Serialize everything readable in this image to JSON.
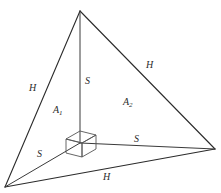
{
  "figure": {
    "type": "geometry-diagram",
    "background_color": "#ffffff",
    "line_color": "#2b2b2b",
    "labels": [
      {
        "id": "h-left",
        "text": "H",
        "sub": "",
        "x": 29,
        "y": 83
      },
      {
        "id": "h-right",
        "text": "H",
        "sub": "",
        "x": 146,
        "y": 60
      },
      {
        "id": "s-vert",
        "text": "S",
        "sub": "",
        "x": 85,
        "y": 76
      },
      {
        "id": "a1",
        "text": "A",
        "sub": "1",
        "x": 53,
        "y": 105
      },
      {
        "id": "a2",
        "text": "A",
        "sub": "2",
        "x": 123,
        "y": 97
      },
      {
        "id": "s-left",
        "text": "S",
        "sub": "",
        "x": 37,
        "y": 149
      },
      {
        "id": "s-base",
        "text": "S",
        "sub": "",
        "x": 134,
        "y": 134
      },
      {
        "id": "h-bottom",
        "text": "H",
        "sub": "",
        "x": 103,
        "y": 172
      }
    ],
    "vertices": {
      "apex": {
        "x": 80,
        "y": 11
      },
      "bottom_left": {
        "x": 5,
        "y": 187
      },
      "right": {
        "x": 215,
        "y": 149
      },
      "foot": {
        "x": 80,
        "y": 143
      }
    },
    "edges": [
      {
        "id": "apex-to-bottom-left",
        "label": "H"
      },
      {
        "id": "apex-to-right",
        "label": "H"
      },
      {
        "id": "bottom-left-to-right",
        "label": "H"
      },
      {
        "id": "apex-to-foot",
        "label": "S"
      },
      {
        "id": "bottom-left-to-foot",
        "label": "S"
      },
      {
        "id": "foot-to-right",
        "label": "S"
      }
    ],
    "faces": [
      {
        "id": "left-face",
        "label": "A",
        "sub": "1"
      },
      {
        "id": "right-face",
        "label": "A",
        "sub": "2"
      }
    ],
    "right_angle_marker": {
      "id": "cube-marker",
      "shape": "cube",
      "at": {
        "x": 80,
        "y": 143
      }
    }
  }
}
